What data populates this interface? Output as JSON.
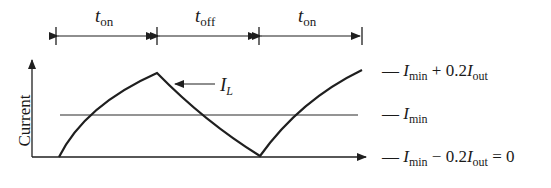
{
  "diagram": {
    "type": "inductor-current-waveform",
    "y_axis_label": "Current",
    "curve_label": {
      "main": "I",
      "sub": "L"
    },
    "intervals": [
      {
        "main": "t",
        "sub": "on"
      },
      {
        "main": "t",
        "sub": "off"
      },
      {
        "main": "t",
        "sub": "on"
      }
    ],
    "levels": [
      {
        "id": "max",
        "dash": "—",
        "I": "I",
        "I_sub": "min",
        "op": "+ 0.2",
        "I2": "I",
        "I2_sub": "out",
        "tail": ""
      },
      {
        "id": "mid",
        "dash": "—",
        "I": "I",
        "I_sub": "min",
        "op": "",
        "I2": "",
        "I2_sub": "",
        "tail": ""
      },
      {
        "id": "min",
        "dash": "—",
        "I": "I",
        "I_sub": "min",
        "op": "− 0.2",
        "I2": "I",
        "I2_sub": "out",
        "tail": " = 0"
      }
    ],
    "colors": {
      "line": "#1f1f1f",
      "background": "#ffffff"
    }
  }
}
